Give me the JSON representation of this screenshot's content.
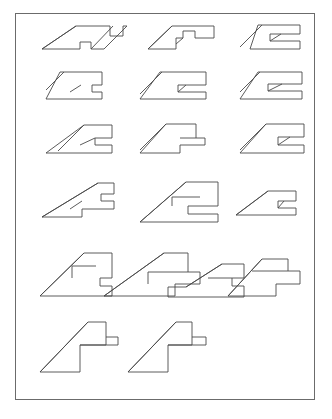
{
  "figure": {
    "title": "",
    "background_color": "#ffffff",
    "border_color": "#6b6b6b",
    "stroke_color": "#4a4a4a",
    "border": {
      "x": 15,
      "y": 13,
      "width": 300,
      "height": 387
    },
    "canvas": {
      "width": 332,
      "height": 419
    },
    "projection": {
      "type": "oblique",
      "depth_dx": -46,
      "depth_dy": 46,
      "unit_x": 34,
      "unit_y": 0
    },
    "rows": [
      {
        "index": 1,
        "count": 3,
        "baseline_y": 70
      },
      {
        "index": 2,
        "count": 3,
        "baseline_y": 122
      },
      {
        "index": 3,
        "count": 3,
        "baseline_y": 172
      },
      {
        "index": 4,
        "count": 3,
        "baseline_y": 238
      },
      {
        "index": 5,
        "count": 4,
        "baseline_y": 313
      },
      {
        "index": 6,
        "count": 2,
        "baseline_y": 386
      }
    ],
    "shape_count": 19,
    "shapes": [
      {
        "id": "r1c1",
        "label": "shape-row1-col1",
        "outline": "M 76,26 L 110,26 L 110,36 L 123,36 L 123,26 L 127,26 L 104,49 L 91,49 L 91,42 L 80,42 L 80,49 L 42,49 L 76,26 Z",
        "inner": [
          "M 76,26 L 42,49",
          "M 91,49 L 113,26"
        ]
      },
      {
        "id": "r1c2",
        "label": "shape-row1-col2",
        "outline": "M 172,26 L 214,26 L 214,38 L 195,38 L 195,31 L 183,31 L 183,38 L 176,38 L 176,49 L 148,49 L 172,26 Z",
        "inner": [
          "M 172,26 L 148,49",
          "M 183,38 L 176,44"
        ]
      },
      {
        "id": "r1c3",
        "label": "shape-row1-col3",
        "outline": "M 258,25 L 300,25 L 300,34 L 270,34 L 270,41 L 300,41 L 300,49 L 250,49 L 258,25 Z",
        "inner": [
          "M 262,25 L 240,47",
          "M 281,34 L 270,41"
        ]
      },
      {
        "id": "r2c1",
        "label": "shape-row2-col1",
        "outline": "M 60,72 L 102,72 L 102,85 L 92,85 L 92,92 L 102,92 L 102,99 L 46,99 L 60,72 Z",
        "inner": [
          "M 64,72 L 46,90",
          "M 81,85 L 70,92"
        ]
      },
      {
        "id": "r2c2",
        "label": "shape-row2-col2",
        "outline": "M 160,72 L 206,72 L 206,85 L 178,85 L 178,92 L 206,92 L 206,99 L 140,99 L 160,72 Z",
        "inner": [
          "M 162,72 L 140,94",
          "M 186,85 L 178,92"
        ]
      },
      {
        "id": "r2c3",
        "label": "shape-row2-col3",
        "outline": "M 258,72 L 302,72 L 302,84 L 268,84 L 268,91 L 302,91 L 302,99 L 240,99 L 258,72 Z",
        "inner": [
          "M 260,72 L 240,92",
          "M 282,84 L 268,91"
        ]
      },
      {
        "id": "r3c1",
        "label": "shape-row3-col1",
        "outline": "M 84,125 L 112,125 L 112,138 L 95,138 L 95,145 L 112,145 L 112,153 L 46,153 L 84,125 Z",
        "inner": [
          "M 84,125 L 58,151",
          "M 95,138 L 80,145"
        ]
      },
      {
        "id": "r3c2",
        "label": "shape-row3-col2",
        "outline": "M 166,124 L 196,124 L 196,138 L 205,138 L 205,145 L 180,145 L 180,153 L 140,153 L 166,124 Z",
        "inner": [
          "M 166,124 L 140,150",
          "M 180,138 L 196,138"
        ]
      },
      {
        "id": "r3c3",
        "label": "shape-row3-col3",
        "outline": "M 266,124 L 304,124 L 304,137 L 278,137 L 278,145 L 304,145 L 304,153 L 240,153 L 266,124 Z",
        "inner": [
          "M 266,124 L 240,150",
          "M 290,137 L 278,145"
        ]
      },
      {
        "id": "r4c1",
        "label": "shape-row4-col1",
        "outline": "M 98,183 L 114,183 L 114,194 L 101,194 L 101,201 L 114,201 L 114,209 L 82,209 L 82,217 L 42,217 L 98,183 Z",
        "inner": [
          "M 98,183 L 42,217",
          "M 70,209 L 82,201"
        ]
      },
      {
        "id": "r4c2",
        "label": "shape-row4-col2",
        "outline": "M 186,182 L 218,182 L 218,206 L 188,206 L 188,214 L 218,214 L 218,222 L 140,222 L 186,182 Z",
        "inner": [
          "M 186,182 L 140,222",
          "M 200,197 L 172,197",
          "M 172,197 L 172,206"
        ]
      },
      {
        "id": "r4c3",
        "label": "shape-row4-col3",
        "outline": "M 268,191 L 296,191 L 296,201 L 278,201 L 278,208 L 296,208 L 296,215 L 236,215 L 268,191 Z",
        "inner": [
          "M 268,191 L 236,215",
          "M 284,201 L 278,208"
        ]
      },
      {
        "id": "r5c1",
        "label": "shape-row5-col1",
        "outline": "M 84,253 L 112,253 L 112,278 L 100,278 L 100,286 L 112,286 L 112,296 L 40,296 L 84,253 Z",
        "inner": [
          "M 84,253 L 40,296",
          "M 96,266 L 72,266",
          "M 72,266 L 72,278"
        ]
      },
      {
        "id": "r5c2",
        "label": "shape-row5-col2",
        "outline": "M 164,253 L 188,253 L 188,272 L 200,272 L 200,284 L 175,284 L 175,296 L 104,296 L 164,253 Z",
        "inner": [
          "M 164,253 L 104,296",
          "M 148,272 L 188,272",
          "M 148,272 L 148,284"
        ]
      },
      {
        "id": "r5c3",
        "label": "shape-row5-col3",
        "outline": "M 222,264 L 244,264 L 244,278 L 232,278 L 232,286 L 244,286 L 244,297 L 168,297 L 168,287 L 186,287 L 222,264 Z",
        "inner": [
          "M 222,264 L 186,287",
          "M 232,278 L 208,278"
        ]
      },
      {
        "id": "r5c4",
        "label": "shape-row5-col4",
        "outline": "M 262,259 L 288,259 L 288,271 L 300,271 L 300,284 L 276,284 L 276,296 L 228,296 L 262,259 Z",
        "inner": [
          "M 262,259 L 228,296",
          "M 252,271 L 288,271"
        ]
      },
      {
        "id": "r6c1",
        "label": "shape-row6-col1",
        "outline": "M 88,322 L 106,322 L 106,337 L 118,337 L 118,345 L 80,345 L 80,372 L 40,372 L 88,322 Z",
        "inner": [
          "M 88,322 L 40,372",
          "M 80,345 L 106,345",
          "M 106,337 L 106,345"
        ]
      },
      {
        "id": "r6c2",
        "label": "shape-row6-col2",
        "outline": "M 176,322 L 192,322 L 192,337 L 206,337 L 206,345 L 168,345 L 168,372 L 128,372 L 176,322 Z",
        "inner": [
          "M 176,322 L 128,372",
          "M 168,345 L 192,345",
          "M 192,337 L 192,345"
        ]
      }
    ]
  }
}
